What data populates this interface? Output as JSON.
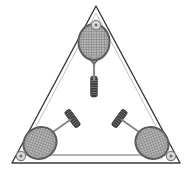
{
  "figure": {
    "title": "Three rackets in triangular frame",
    "background_color": "#ffffff",
    "width": 192,
    "height": 171
  },
  "frame": {
    "name": "triangular-frame",
    "shape": "triangle",
    "outline_color": "#3a3a3a",
    "inner_line_color": "#6a6a6a",
    "fill_color": "#ffffff",
    "apex": {
      "x": 96,
      "y": 6
    },
    "bottom_left": {
      "x": 12,
      "y": 163
    },
    "bottom_right": {
      "x": 180,
      "y": 163
    },
    "inner_bottom_rail_y": 155,
    "stroke_width": 1.4
  },
  "bolts": [
    {
      "name": "bolt-apex",
      "x": 96,
      "y": 25,
      "radius": 4.6,
      "ring_color": "#7d7d7d",
      "fill_color": "#d9d9d9",
      "center_dot_color": "#6b6b6b"
    },
    {
      "name": "bolt-bottom-left",
      "x": 21,
      "y": 156,
      "radius": 4.6,
      "ring_color": "#7d7d7d",
      "fill_color": "#d9d9d9",
      "center_dot_color": "#6b6b6b"
    },
    {
      "name": "bolt-bottom-right",
      "x": 171,
      "y": 156,
      "radius": 4.6,
      "ring_color": "#7d7d7d",
      "fill_color": "#d9d9d9",
      "center_dot_color": "#6b6b6b"
    }
  ],
  "rackets": [
    {
      "name": "racket-top",
      "position": "top",
      "head": {
        "cx": 94,
        "cy": 43,
        "rx": 15,
        "ry": 18,
        "rotation": 0
      },
      "shaft": {
        "x1": 94,
        "y1": 61,
        "x2": 94,
        "y2": 80
      },
      "grip": {
        "x1": 94,
        "y1": 78,
        "x2": 94,
        "y2": 97,
        "rotation": 0
      },
      "angle_deg": 0,
      "string_color": "#8e8e8e",
      "frame_color": "#5c5c5c",
      "shaft_color": "#8a8a8a",
      "grip_color": "#3b3b3b"
    },
    {
      "name": "racket-bottom-left",
      "position": "bottom-left",
      "head": {
        "cx": 41,
        "cy": 142,
        "rx": 16,
        "ry": 15,
        "rotation": -35
      },
      "shaft": {
        "x1": 52,
        "y1": 133,
        "x2": 67,
        "y2": 122
      },
      "grip": {
        "x1": 65,
        "y1": 124,
        "x2": 80,
        "y2": 113,
        "rotation": -36
      },
      "angle_deg": -36,
      "string_color": "#8e8e8e",
      "frame_color": "#5c5c5c",
      "shaft_color": "#8a8a8a",
      "grip_color": "#3b3b3b"
    },
    {
      "name": "racket-bottom-right",
      "position": "bottom-right",
      "head": {
        "cx": 148,
        "cy": 142,
        "rx": 16,
        "ry": 15,
        "rotation": 35
      },
      "shaft": {
        "x1": 137,
        "y1": 133,
        "x2": 122,
        "y2": 122
      },
      "grip": {
        "x1": 124,
        "y1": 124,
        "x2": 109,
        "y2": 113,
        "rotation": 36
      },
      "angle_deg": 36,
      "string_color": "#8e8e8e",
      "frame_color": "#5c5c5c",
      "shaft_color": "#8a8a8a",
      "grip_color": "#3b3b3b"
    }
  ]
}
